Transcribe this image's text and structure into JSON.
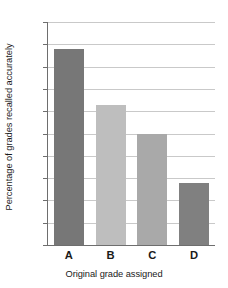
{
  "chart_data": {
    "type": "bar",
    "title": "",
    "categories": [
      "A",
      "B",
      "C",
      "D"
    ],
    "values": [
      88,
      63,
      50,
      28
    ],
    "series": [
      {
        "name": "Percentage of grades recalled accurately",
        "values": [
          88,
          63,
          50,
          28
        ]
      }
    ],
    "xlabel": "Original grade assigned",
    "ylabel": "Percentage of grades recalled accurately",
    "ylim": [
      0,
      100
    ],
    "yticks": [
      0,
      10,
      20,
      30,
      40,
      50,
      60,
      70,
      80,
      90,
      100
    ],
    "ytick_labels": [
      "0",
      "10",
      "20",
      "30",
      "40",
      "50",
      "60",
      "70",
      "80",
      "90",
      "100"
    ],
    "grid": true,
    "legend": false,
    "legend_position": "none",
    "bar_colors": [
      "#777777",
      "#bebebe",
      "#a9a9a9",
      "#808080"
    ],
    "colors": {
      "gridline": "#c9c9c9",
      "axis": "#6e6e6e",
      "background": "#ffffff",
      "text": "#1a1a1a"
    }
  }
}
